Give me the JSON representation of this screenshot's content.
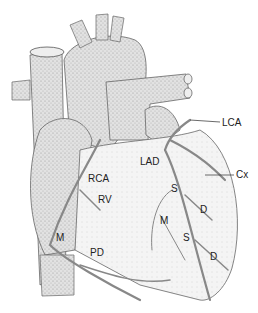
{
  "diagram": {
    "colors": {
      "stipple": "#c8c8c8",
      "outline": "#6a6a6a",
      "artery": "#8a8a8a",
      "label": "#222222"
    },
    "labels": [
      {
        "id": "lca",
        "text": "LCA",
        "x": 222,
        "y": 118
      },
      {
        "id": "cx",
        "text": "Cx",
        "x": 236,
        "y": 170
      },
      {
        "id": "lad",
        "text": "LAD",
        "x": 140,
        "y": 157
      },
      {
        "id": "rca",
        "text": "RCA",
        "x": 88,
        "y": 174
      },
      {
        "id": "rv",
        "text": "RV",
        "x": 98,
        "y": 195
      },
      {
        "id": "s1",
        "text": "S",
        "x": 171,
        "y": 184
      },
      {
        "id": "d1",
        "text": "D",
        "x": 200,
        "y": 205
      },
      {
        "id": "m1",
        "text": "M",
        "x": 160,
        "y": 216
      },
      {
        "id": "s2",
        "text": "S",
        "x": 183,
        "y": 233
      },
      {
        "id": "d2",
        "text": "D",
        "x": 210,
        "y": 252
      },
      {
        "id": "m2",
        "text": "M",
        "x": 56,
        "y": 233
      },
      {
        "id": "pd",
        "text": "PD",
        "x": 90,
        "y": 248
      }
    ]
  }
}
